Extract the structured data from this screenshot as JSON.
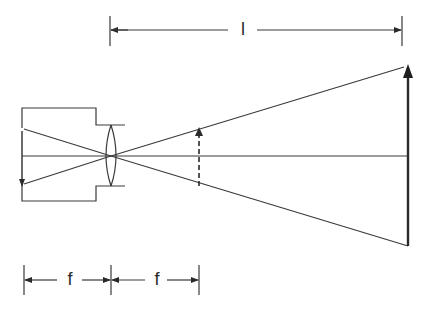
{
  "diagram": {
    "labels": {
      "distance": "l",
      "focal_left": "f",
      "focal_right": "f"
    },
    "elements": {
      "camera_body": "camera-body",
      "lens": "convex-lens",
      "optical_axis": "optical-axis",
      "film_image": "inverted-image-arrow",
      "virtual_image": "dashed-image-arrow",
      "object": "object-arrow"
    },
    "colors": {
      "line": "#3a3a3a",
      "background": "#ffffff"
    }
  }
}
